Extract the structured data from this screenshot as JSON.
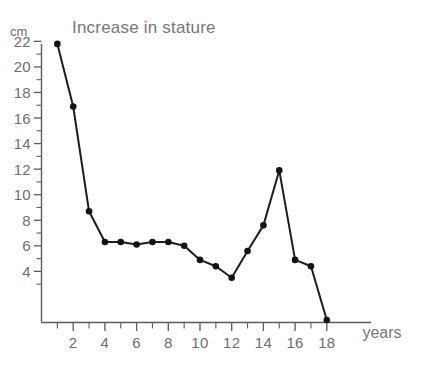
{
  "chart_data": {
    "type": "line",
    "title": "Increase in stature",
    "xlabel": "years",
    "ylabel": "cm",
    "xlim": [
      0,
      19
    ],
    "ylim": [
      0,
      23
    ],
    "grid": false,
    "legend": "none",
    "x_ticks_major": [
      2,
      4,
      6,
      8,
      10,
      12,
      14,
      16,
      18
    ],
    "x_ticks_minor": [
      1,
      3,
      5,
      7,
      9,
      11,
      13,
      15,
      17
    ],
    "y_ticks_major": [
      4,
      6,
      8,
      10,
      12,
      14,
      16,
      18,
      20,
      22
    ],
    "y_ticks_minor": [
      3,
      5,
      7,
      9,
      11,
      13,
      15,
      17,
      19,
      21,
      23
    ],
    "x": [
      1,
      2,
      3,
      4,
      5,
      6,
      7,
      8,
      9,
      10,
      11,
      12,
      13,
      14,
      15,
      16,
      17,
      18
    ],
    "values": [
      21.8,
      16.9,
      8.7,
      6.3,
      6.3,
      6.1,
      6.3,
      6.3,
      6.0,
      4.9,
      4.4,
      3.5,
      5.6,
      7.6,
      11.9,
      4.9,
      4.4,
      0.2
    ],
    "series": [
      {
        "name": "Increase in stature",
        "values": [
          21.8,
          16.9,
          8.7,
          6.3,
          6.3,
          6.1,
          6.3,
          6.3,
          6.0,
          4.9,
          4.4,
          3.5,
          5.6,
          7.6,
          11.9,
          4.9,
          4.4,
          0.2
        ]
      }
    ],
    "marker": "filled-circle",
    "line_color": "#1d1d1d",
    "marker_color": "#141414",
    "axis_color": "#5b5b5b",
    "text_color": "#6d6d6d",
    "background": "#ffffff"
  }
}
